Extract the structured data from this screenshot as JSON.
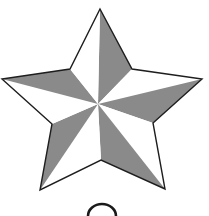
{
  "figure": {
    "icon": "star-icon",
    "colors": {
      "background": "#ffffff",
      "light_facet": "#ffffff",
      "dark_facet": "#8a8a8a",
      "outline": "#1e1e1e"
    },
    "facet_pattern": [
      "light",
      "dark",
      "light",
      "dark",
      "light",
      "dark",
      "light",
      "dark",
      "light",
      "dark"
    ],
    "bottom_glyph": "circle-partial-icon"
  }
}
